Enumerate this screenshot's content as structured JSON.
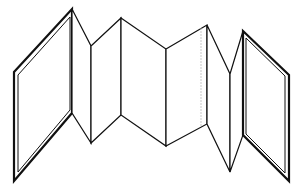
{
  "diagram": {
    "subject": "accordion-fold book (concertina)",
    "stroke_color": "#111111",
    "background": "#ffffff",
    "panels": [
      {
        "id": "left-cover",
        "points": [
          [
            14,
            72
          ],
          [
            72,
            9
          ],
          [
            72,
            113
          ],
          [
            14,
            181
          ]
        ],
        "double_border": true
      },
      {
        "id": "fold-1",
        "points": [
          [
            72,
            9
          ],
          [
            91,
            46
          ],
          [
            91,
            143
          ],
          [
            72,
            113
          ]
        ]
      },
      {
        "id": "fold-2",
        "points": [
          [
            91,
            46
          ],
          [
            121,
            18
          ],
          [
            121,
            115
          ],
          [
            91,
            143
          ]
        ]
      },
      {
        "id": "fold-3",
        "points": [
          [
            121,
            18
          ],
          [
            166,
            49
          ],
          [
            166,
            146
          ],
          [
            121,
            115
          ]
        ]
      },
      {
        "id": "fold-4",
        "points": [
          [
            166,
            49
          ],
          [
            207,
            25
          ],
          [
            207,
            124
          ],
          [
            166,
            146
          ]
        ]
      },
      {
        "id": "fold-5",
        "points": [
          [
            207,
            25
          ],
          [
            230,
            74
          ],
          [
            230,
            172
          ],
          [
            207,
            124
          ]
        ]
      },
      {
        "id": "fold-6",
        "points": [
          [
            230,
            74
          ],
          [
            243,
            31
          ],
          [
            243,
            135
          ],
          [
            230,
            172
          ]
        ]
      },
      {
        "id": "right-cover",
        "points": [
          [
            243,
            31
          ],
          [
            289,
            75
          ],
          [
            289,
            181
          ],
          [
            243,
            135
          ]
        ],
        "double_border": true
      }
    ],
    "hidden_line": {
      "x": 201,
      "y1": 28,
      "y2": 127
    }
  }
}
